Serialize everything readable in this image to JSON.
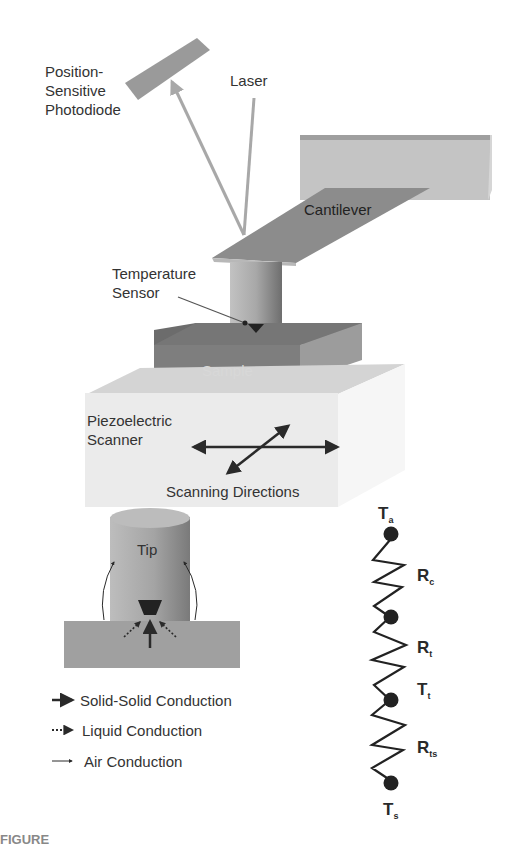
{
  "figure": {
    "components": {
      "photodiode": "Position-\nSensitive\nPhotodiode",
      "photodiode_lines": [
        "Position-",
        "Sensitive",
        "Photodiode"
      ],
      "laser": "Laser",
      "cantilever": "Cantilever",
      "temperature_sensor_lines": [
        "Temperature",
        "Sensor"
      ],
      "sample": "Sample",
      "scanner_lines": [
        "Piezoelectric",
        "Scanner"
      ],
      "scanning_directions": "Scanning Directions",
      "tip": "Tip"
    },
    "legend": [
      {
        "label": "Solid-Solid Conduction",
        "style": "solid-thick"
      },
      {
        "label": "Liquid Conduction",
        "style": "dotted"
      },
      {
        "label": "Air Conduction",
        "style": "thin"
      }
    ],
    "thermal_network": {
      "nodes": [
        {
          "symbol": "T",
          "subscript": "a"
        },
        {
          "symbol": "T",
          "subscript": "t"
        },
        {
          "symbol": "T",
          "subscript": "s"
        }
      ],
      "resistors": [
        {
          "symbol": "R",
          "subscript": "c"
        },
        {
          "symbol": "R",
          "subscript": "t"
        },
        {
          "symbol": "R",
          "subscript": "ts"
        }
      ]
    },
    "colors": {
      "background": "#ffffff",
      "photodiode": "#9a9a9a",
      "laser_beam": "#a8a8a8",
      "cantilever": "#8c8c8c",
      "holder_block": "#c4c4c4",
      "sample": "#7e7e7e",
      "scanner": "#ebebeb",
      "tip": "#a6a6a6",
      "arrow": "#2a2a2a",
      "node": "#222222"
    },
    "caption_fragment": "FIGURE"
  }
}
